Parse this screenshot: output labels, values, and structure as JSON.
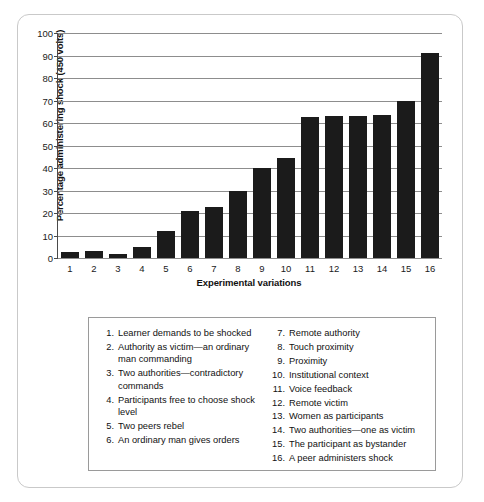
{
  "chart_data": {
    "type": "bar",
    "title": "",
    "xlabel": "Experimental variations",
    "ylabel": "Percentage administering shock (450 volts)",
    "categories": [
      "1",
      "2",
      "3",
      "4",
      "5",
      "6",
      "7",
      "8",
      "9",
      "10",
      "11",
      "12",
      "13",
      "14",
      "15",
      "16"
    ],
    "values": [
      2.5,
      3,
      2,
      5,
      12,
      21,
      22.5,
      30,
      40,
      44.5,
      62.5,
      63,
      63,
      63.5,
      70,
      91
    ],
    "ylim": [
      0,
      100
    ],
    "yticks": [
      0,
      10,
      20,
      30,
      40,
      50,
      60,
      70,
      80,
      90,
      100
    ],
    "ytick_labels": [
      "0",
      "10",
      "20",
      "30",
      "40",
      "50",
      "60",
      "70",
      "80",
      "90",
      "100"
    ],
    "grid": "horizontal",
    "legend_position": "below-chart",
    "bar_color": "#1b1b1b",
    "gridline_color": "#8d8d8d",
    "axis_color": "#4a4a4a"
  },
  "legend": {
    "left_column": [
      {
        "num": "1.",
        "text": "Learner demands to be shocked"
      },
      {
        "num": "2.",
        "text": "Authority as victim—an ordinary man commanding"
      },
      {
        "num": "3.",
        "text": "Two authorities—contradictory commands"
      },
      {
        "num": "4.",
        "text": "Participants free to choose shock level"
      },
      {
        "num": "5.",
        "text": "Two peers rebel"
      },
      {
        "num": "6.",
        "text": "An ordinary man gives orders"
      }
    ],
    "right_column": [
      {
        "num": "7.",
        "text": "Remote authority"
      },
      {
        "num": "8.",
        "text": "Touch proximity"
      },
      {
        "num": "9.",
        "text": "Proximity"
      },
      {
        "num": "10.",
        "text": "Institutional context"
      },
      {
        "num": "11.",
        "text": "Voice feedback"
      },
      {
        "num": "12.",
        "text": "Remote victim"
      },
      {
        "num": "13.",
        "text": "Women as participants"
      },
      {
        "num": "14.",
        "text": "Two authorities—one as victim"
      },
      {
        "num": "15.",
        "text": "The participant as bystander"
      },
      {
        "num": "16.",
        "text": "A peer administers shock"
      }
    ]
  }
}
